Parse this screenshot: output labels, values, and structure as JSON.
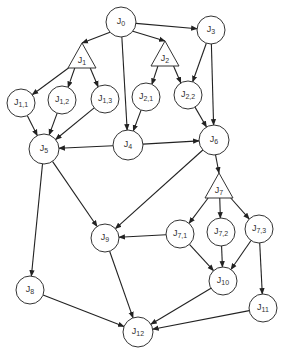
{
  "diagram": {
    "title": "",
    "nodes": [
      {
        "id": "J0",
        "base": "J",
        "sub": "0",
        "shape": "circle",
        "x": 121,
        "y": 22,
        "r": 15
      },
      {
        "id": "J1",
        "base": "J",
        "sub": "1",
        "shape": "triangle",
        "x": 82,
        "y": 58
      },
      {
        "id": "J2",
        "base": "J",
        "sub": "2",
        "shape": "triangle",
        "x": 165,
        "y": 56
      },
      {
        "id": "J3",
        "base": "J",
        "sub": "3",
        "shape": "circle",
        "x": 211,
        "y": 30,
        "r": 14
      },
      {
        "id": "J1,1",
        "base": "J",
        "sub": "1,1",
        "shape": "circle",
        "x": 21,
        "y": 103,
        "r": 14
      },
      {
        "id": "J1,2",
        "base": "J",
        "sub": "1,2",
        "shape": "circle",
        "x": 62,
        "y": 100,
        "r": 14
      },
      {
        "id": "J1,3",
        "base": "J",
        "sub": "1,3",
        "shape": "circle",
        "x": 105,
        "y": 99,
        "r": 14
      },
      {
        "id": "J2,1",
        "base": "J",
        "sub": "2,1",
        "shape": "circle",
        "x": 146,
        "y": 97,
        "r": 14
      },
      {
        "id": "J2,2",
        "base": "J",
        "sub": "2,2",
        "shape": "circle",
        "x": 188,
        "y": 95,
        "r": 14
      },
      {
        "id": "J4",
        "base": "J",
        "sub": "4",
        "shape": "circle",
        "x": 128,
        "y": 145,
        "r": 15
      },
      {
        "id": "J5",
        "base": "J",
        "sub": "5",
        "shape": "circle",
        "x": 44,
        "y": 149,
        "r": 15
      },
      {
        "id": "J6",
        "base": "J",
        "sub": "6",
        "shape": "circle",
        "x": 214,
        "y": 140,
        "r": 15
      },
      {
        "id": "J7",
        "base": "J",
        "sub": "7",
        "shape": "triangle",
        "x": 219,
        "y": 188
      },
      {
        "id": "J7,1",
        "base": "J",
        "sub": "7,1",
        "shape": "circle",
        "x": 180,
        "y": 234,
        "r": 14
      },
      {
        "id": "J7,2",
        "base": "J",
        "sub": "7,2",
        "shape": "circle",
        "x": 221,
        "y": 232,
        "r": 14
      },
      {
        "id": "J7,3",
        "base": "J",
        "sub": "7,3",
        "shape": "circle",
        "x": 259,
        "y": 229,
        "r": 14
      },
      {
        "id": "J8",
        "base": "J",
        "sub": "8",
        "shape": "circle",
        "x": 30,
        "y": 290,
        "r": 14
      },
      {
        "id": "J9",
        "base": "J",
        "sub": "9",
        "shape": "circle",
        "x": 105,
        "y": 238,
        "r": 14
      },
      {
        "id": "J10",
        "base": "J",
        "sub": "10",
        "shape": "circle",
        "x": 223,
        "y": 281,
        "r": 14
      },
      {
        "id": "J11",
        "base": "J",
        "sub": "11",
        "shape": "circle",
        "x": 263,
        "y": 308,
        "r": 14
      },
      {
        "id": "J12",
        "base": "J",
        "sub": "12",
        "shape": "circle",
        "x": 138,
        "y": 332,
        "r": 15
      }
    ],
    "edges": [
      {
        "from": "J0",
        "to": "J1"
      },
      {
        "from": "J0",
        "to": "J2"
      },
      {
        "from": "J0",
        "to": "J3"
      },
      {
        "from": "J0",
        "to": "J4"
      },
      {
        "from": "J1",
        "to": "J1,1"
      },
      {
        "from": "J1",
        "to": "J1,2"
      },
      {
        "from": "J1",
        "to": "J1,3"
      },
      {
        "from": "J2",
        "to": "J2,1"
      },
      {
        "from": "J2",
        "to": "J2,2"
      },
      {
        "from": "J3",
        "to": "J2,2"
      },
      {
        "from": "J3",
        "to": "J6"
      },
      {
        "from": "J1,1",
        "to": "J5"
      },
      {
        "from": "J1,2",
        "to": "J5"
      },
      {
        "from": "J1,3",
        "to": "J5"
      },
      {
        "from": "J2,1",
        "to": "J4"
      },
      {
        "from": "J2,2",
        "to": "J6"
      },
      {
        "from": "J4",
        "to": "J5"
      },
      {
        "from": "J4",
        "to": "J6"
      },
      {
        "from": "J5",
        "to": "J8"
      },
      {
        "from": "J5",
        "to": "J9"
      },
      {
        "from": "J6",
        "to": "J9"
      },
      {
        "from": "J6",
        "to": "J7"
      },
      {
        "from": "J7",
        "to": "J7,1"
      },
      {
        "from": "J7",
        "to": "J7,2"
      },
      {
        "from": "J7",
        "to": "J7,3"
      },
      {
        "from": "J7,1",
        "to": "J9"
      },
      {
        "from": "J7,1",
        "to": "J10"
      },
      {
        "from": "J7,2",
        "to": "J10"
      },
      {
        "from": "J7,3",
        "to": "J10"
      },
      {
        "from": "J7,3",
        "to": "J11"
      },
      {
        "from": "J8",
        "to": "J12"
      },
      {
        "from": "J9",
        "to": "J12"
      },
      {
        "from": "J10",
        "to": "J12"
      },
      {
        "from": "J11",
        "to": "J12"
      }
    ]
  }
}
